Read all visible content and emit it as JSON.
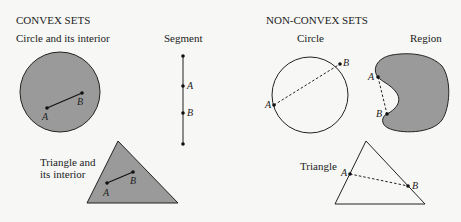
{
  "convex": {
    "heading": "CONVEX SETS",
    "circle": {
      "label": "Circle and its interior",
      "point_a": "A",
      "point_b": "B"
    },
    "segment": {
      "label": "Segment",
      "point_a": "A",
      "point_b": "B"
    },
    "triangle": {
      "label_line1": "Triangle and",
      "label_line2": "its interior",
      "point_a": "A",
      "point_b": "B"
    }
  },
  "non_convex": {
    "heading": "NON-CONVEX SETS",
    "circle": {
      "label": "Circle",
      "point_a": "A",
      "point_b": "B"
    },
    "region": {
      "label": "Region",
      "point_a": "A",
      "point_b": "B"
    },
    "triangle": {
      "label": "Triangle",
      "point_a": "A",
      "point_b": "B"
    }
  },
  "colors": {
    "fill": "#9a9a9a",
    "stroke": "#222222",
    "background": "#f7f7f5"
  }
}
